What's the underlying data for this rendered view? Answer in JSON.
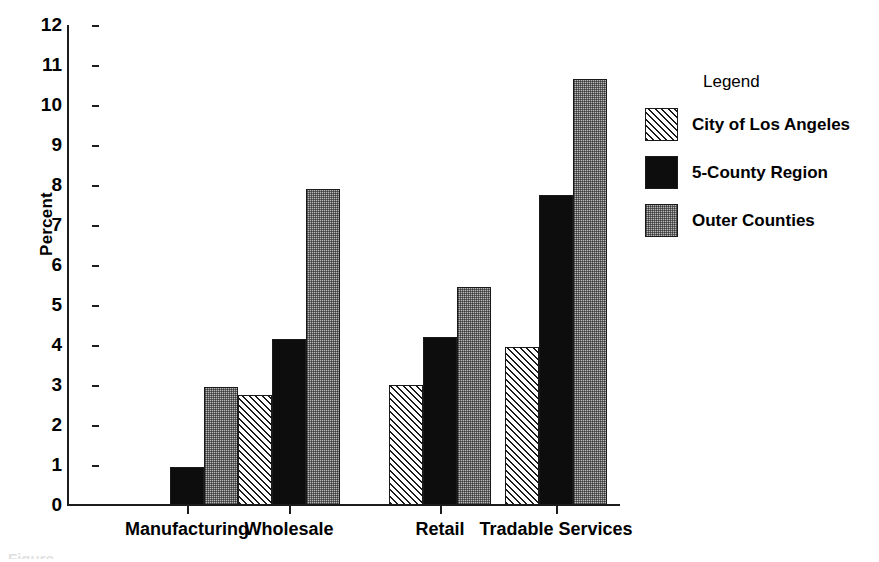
{
  "chart_data": {
    "type": "bar",
    "title": "",
    "subtitle": "",
    "xlabel": "",
    "ylabel": "Percent",
    "ylim": [
      0,
      12
    ],
    "yticks": [
      0,
      1,
      2,
      3,
      4,
      5,
      6,
      7,
      8,
      9,
      10,
      11,
      12
    ],
    "ytick_labels": [
      "0",
      "1",
      "2",
      "3",
      "4",
      "5",
      "6",
      "7",
      "8",
      "9",
      "10",
      "11",
      "12"
    ],
    "grid": false,
    "legend_position": "right",
    "legend_title": "Legend",
    "categories": [
      "Manufacturing",
      "Wholesale",
      "Retail",
      "Tradable Services"
    ],
    "series": [
      {
        "name": "City of Los Angeles",
        "pattern": "diagonal-hatch",
        "color": "#ffffff",
        "values": [
          0,
          2.75,
          3.0,
          3.95
        ]
      },
      {
        "name": "5-County Region",
        "pattern": "solid-black",
        "color": "#0d0d0d",
        "values": [
          0.95,
          4.15,
          4.2,
          7.75
        ]
      },
      {
        "name": "Outer Counties",
        "pattern": "gray-stipple",
        "color": "#b9b9b9",
        "values": [
          2.95,
          7.9,
          5.45,
          10.65
        ]
      }
    ],
    "annotations": []
  },
  "axis": {
    "y_title": "Percent"
  },
  "legend": {
    "title": "Legend",
    "items": [
      {
        "label": "City of Los Angeles"
      },
      {
        "label": "5-County Region"
      },
      {
        "label": "Outer Counties"
      }
    ]
  },
  "caption_sliver": "Figure"
}
